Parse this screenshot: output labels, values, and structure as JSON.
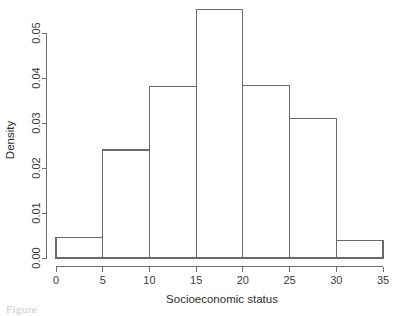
{
  "figure": {
    "background_color": "#ffffff",
    "line_color": "#6a6a6a",
    "text_color": "#2e2e2e",
    "caption_fragment": "Figure"
  },
  "chart_data": {
    "type": "bar",
    "title": "",
    "subtitle": "",
    "xlabel": "Socioeconomic status",
    "ylabel": "Density",
    "xlim": [
      0,
      35
    ],
    "ylim": [
      0,
      0.056
    ],
    "grid": false,
    "legend": null,
    "bin_width": 5,
    "bin_edges": [
      0,
      5,
      10,
      15,
      20,
      25,
      30,
      35
    ],
    "categories": [
      "0-5",
      "5-10",
      "10-15",
      "15-20",
      "20-25",
      "25-30",
      "30-35"
    ],
    "values": [
      0.0045,
      0.024,
      0.0381,
      0.0553,
      0.0384,
      0.0311,
      0.0038
    ],
    "xticks": [
      0,
      5,
      10,
      15,
      20,
      25,
      30,
      35
    ],
    "xticklabels": [
      "0",
      "5",
      "10",
      "15",
      "20",
      "25",
      "30",
      "35"
    ],
    "yticks": [
      0.0,
      0.01,
      0.02,
      0.03,
      0.04,
      0.05
    ],
    "yticklabels": [
      "0.00",
      "0.01",
      "0.02",
      "0.03",
      "0.04",
      "0.05"
    ]
  }
}
